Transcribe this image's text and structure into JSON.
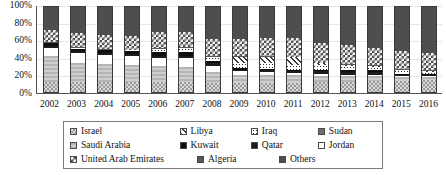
{
  "chart_data": {
    "type": "bar",
    "stacked": true,
    "normalized": true,
    "title": "",
    "xlabel": "",
    "ylabel": "",
    "ylim": [
      0,
      100
    ],
    "ytick_labels": [
      "0%",
      "20%",
      "40%",
      "60%",
      "80%",
      "100%"
    ],
    "ytick_values": [
      0,
      20,
      40,
      60,
      80,
      100
    ],
    "grid": true,
    "legend_position": "bottom",
    "categories": [
      "2002",
      "2003",
      "2004",
      "2005",
      "2006",
      "2007",
      "2008",
      "2009",
      "2010",
      "2011",
      "2012",
      "2013",
      "2014",
      "2015",
      "2016"
    ],
    "series": [
      {
        "name": "Israel",
        "pattern": "israel",
        "values": [
          13,
          13,
          13,
          13,
          13,
          13,
          12,
          12,
          12,
          12,
          13,
          13,
          14,
          14,
          15
        ]
      },
      {
        "name": "Saudi Arabia",
        "pattern": "saudi",
        "values": [
          29,
          22,
          20,
          19,
          18,
          17,
          12,
          9,
          9,
          9,
          7,
          6,
          5,
          4,
          4
        ]
      },
      {
        "name": "Jordan",
        "pattern": "jordan",
        "values": [
          10,
          11,
          11,
          11,
          9,
          10,
          7,
          4,
          3,
          2,
          2,
          2,
          2,
          1,
          1
        ]
      },
      {
        "name": "Qatar",
        "pattern": "qatar",
        "values": [
          2,
          2,
          2,
          2,
          3,
          3,
          3,
          2,
          2,
          2,
          3,
          3,
          3,
          2,
          1
        ]
      },
      {
        "name": "Kuwait",
        "pattern": "kuwait",
        "values": [
          3,
          3,
          3,
          3,
          4,
          4,
          3,
          2,
          2,
          2,
          2,
          2,
          2,
          1,
          1
        ]
      },
      {
        "name": "Iraq",
        "pattern": "iraq",
        "values": [
          1,
          1,
          1,
          1,
          4,
          5,
          5,
          6,
          6,
          5,
          5,
          5,
          4,
          4,
          3
        ]
      },
      {
        "name": "Libya",
        "pattern": "libya",
        "values": [
          0,
          0,
          0,
          0,
          0,
          0,
          0,
          6,
          8,
          9,
          2,
          1,
          1,
          1,
          1
        ]
      },
      {
        "name": "Algeria",
        "pattern": "algeria",
        "values": [
          1,
          1,
          1,
          1,
          1,
          1,
          1,
          1,
          1,
          1,
          1,
          1,
          1,
          1,
          1
        ]
      },
      {
        "name": "United Arab Emirates",
        "pattern": "uae",
        "values": [
          14,
          16,
          16,
          16,
          18,
          17,
          19,
          20,
          20,
          21,
          22,
          22,
          20,
          20,
          20
        ]
      },
      {
        "name": "Others",
        "pattern": "others",
        "values": [
          27,
          31,
          33,
          34,
          30,
          30,
          38,
          38,
          37,
          37,
          43,
          45,
          48,
          52,
          54
        ]
      }
    ]
  },
  "legend": {
    "rows": [
      [
        {
          "label": "Israel",
          "pattern": "israel",
          "col": "col-a"
        },
        {
          "label": "Libya",
          "pattern": "libya",
          "col": "col-b"
        },
        {
          "label": "Iraq",
          "pattern": "iraq",
          "col": "col-c"
        },
        {
          "label": "Sudan",
          "pattern": "sudan",
          "col": "col-d"
        }
      ],
      [
        {
          "label": "Saudi Arabia",
          "pattern": "saudi",
          "col": "col-a"
        },
        {
          "label": "Kuwait",
          "pattern": "kuwait",
          "col": "col-b"
        },
        {
          "label": "Qatar",
          "pattern": "qatar",
          "col": "col-c"
        },
        {
          "label": "Jordan",
          "pattern": "jordan",
          "col": "col-d"
        }
      ],
      [
        {
          "label": "United Arab Emirates",
          "pattern": "uae",
          "col": "col-a"
        },
        {
          "label": "Algeria",
          "pattern": "algeria",
          "col": "col-b"
        },
        {
          "label": "Others",
          "pattern": "others",
          "col": "col-c"
        }
      ]
    ]
  },
  "colors": {
    "axis": "#555555",
    "grid": "#e6e6e6",
    "text": "#111111",
    "legend_border": "#7a7a7a"
  }
}
